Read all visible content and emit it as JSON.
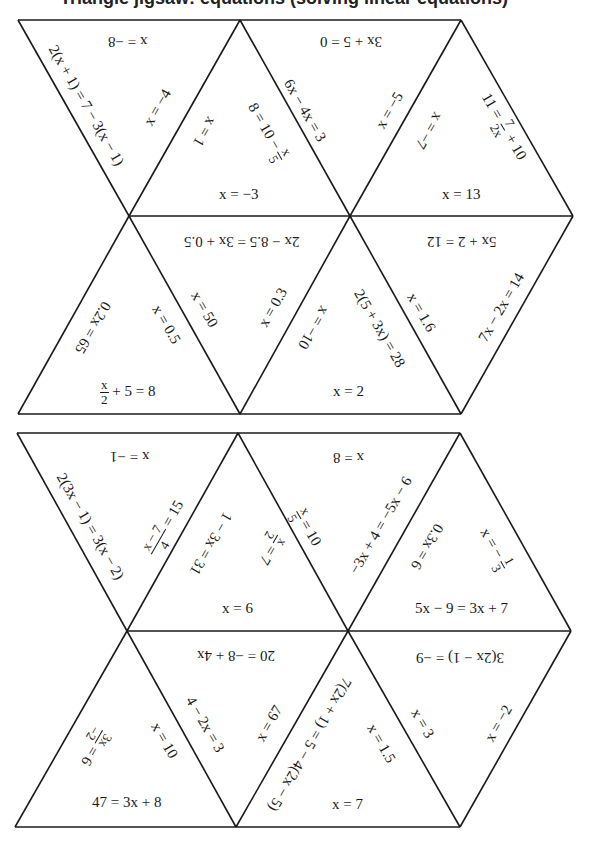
{
  "page": {
    "header_partial": "Triangle jigsaw: equations (solving linear equations)"
  },
  "puzzles": [
    {
      "name": "puzzle-1",
      "triangles": [
        {
          "id": "p1-t1",
          "orientation": "down",
          "edges": {
            "top": "x = −8",
            "left": "2(x + 1) = 7 − 3(x − 1)",
            "right": "x = −4"
          }
        },
        {
          "id": "p1-t2",
          "orientation": "up",
          "edges": {
            "left": "x = 1",
            "right": "8 = 10 − x/5",
            "bottom": "x = −3"
          }
        },
        {
          "id": "p1-t3",
          "orientation": "down",
          "edges": {
            "top": "3x + 5 = 0",
            "left": "6x − 4x = 3",
            "right": "x = −5"
          }
        },
        {
          "id": "p1-t4",
          "orientation": "up",
          "edges": {
            "left": "x = −7",
            "right": "11 = 7/2x + 10",
            "bottom": "x = 13"
          }
        },
        {
          "id": "p1-t5",
          "orientation": "up",
          "edges": {
            "left": "0.2x = 65",
            "right": "x = 0.5",
            "bottom": "x/2 + 5 = 8"
          }
        },
        {
          "id": "p1-t6",
          "orientation": "down",
          "edges": {
            "top": "2x − 8.5 = 3x + 0.5",
            "left": "x = 50",
            "right": "x = 0.3"
          }
        },
        {
          "id": "p1-t7",
          "orientation": "up",
          "edges": {
            "left": "x = −10",
            "right": "2(5 + 3x) = 28",
            "bottom": "x = 2"
          }
        },
        {
          "id": "p1-t8",
          "orientation": "down",
          "edges": {
            "top": "5x + 2 = 12",
            "left": "x = 1.6",
            "right": "7x − 2x = 14"
          }
        }
      ]
    },
    {
      "name": "puzzle-2",
      "triangles": [
        {
          "id": "p2-t1",
          "orientation": "down",
          "edges": {
            "top": "x = −1",
            "left": "2(3x − 1) = 3(x − 2)",
            "right": "(x − 7)/4 = 15"
          }
        },
        {
          "id": "p2-t2",
          "orientation": "up",
          "edges": {
            "left": "1 − 3x = 31",
            "right": "x/2 = 7",
            "bottom": "x = 6"
          }
        },
        {
          "id": "p2-t3",
          "orientation": "down",
          "edges": {
            "top": "x = 8",
            "left": "x/5 = 10",
            "right": "−3x + 4 = −5x − 6"
          }
        },
        {
          "id": "p2-t4",
          "orientation": "up",
          "edges": {
            "left": "0.3x = 6",
            "right": "x = −1/3",
            "bottom": "5x − 9 = 3x + 7"
          }
        },
        {
          "id": "p2-t5",
          "orientation": "up",
          "edges": {
            "left": "3x/−2 = 6",
            "right": "x = 10",
            "bottom": "47 = 3x + 8"
          }
        },
        {
          "id": "p2-t6",
          "orientation": "down",
          "edges": {
            "top": "20 = −8 + 4x",
            "left": "4 − 2x = 3",
            "right": "x = 67"
          }
        },
        {
          "id": "p2-t7",
          "orientation": "up",
          "edges": {
            "left": "7(2x + 1) = 5 − 4(2x − 5)",
            "right": "x = 1.5",
            "bottom": "x = 7"
          }
        },
        {
          "id": "p2-t8",
          "orientation": "down",
          "edges": {
            "top": "3(2x − 1) = −9",
            "left": "x = 3",
            "right": "x = −2"
          }
        }
      ]
    }
  ],
  "labels": {
    "p1": {
      "t1_top": "x = −8",
      "t1_left": "2(x + 1) = 7 − 3(x − 1)",
      "t1_right": "x = −4",
      "t2_left": "x = 1",
      "t2_right_pre": "8 = 10 −",
      "t2_right_num": "x",
      "t2_right_den": "5",
      "t2_bottom": "x = −3",
      "t3_top": "3x + 5 = 0",
      "t3_left": "6x − 4x = 3",
      "t3_right": "x = −5",
      "t4_left": "x = −7",
      "t4_right_pre": "11 =",
      "t4_right_num": "7",
      "t4_right_den": "2x",
      "t4_right_post": "+ 10",
      "t4_bottom": "x = 13",
      "t5_left": "0.2x = 65",
      "t5_right": "x = 0.5",
      "t5_bottom_num": "x",
      "t5_bottom_den": "2",
      "t5_bottom_post": "+ 5 = 8",
      "t6_top": "2x − 8.5 = 3x + 0.5",
      "t6_left": "x = 50",
      "t6_right": "x = 0.3",
      "t7_left": "x = −10",
      "t7_right": "2(5 + 3x) = 28",
      "t7_bottom": "x = 2",
      "t8_top": "5x + 2 = 12",
      "t8_left": "x = 1.6",
      "t8_right": "7x − 2x = 14"
    },
    "p2": {
      "t1_top": "x = −1",
      "t1_left": "2(3x − 1) = 3(x − 2)",
      "t1_right_num": "x − 7",
      "t1_right_den": "4",
      "t1_right_post": "= 15",
      "t2_left": "1 − 3x = 31",
      "t2_right_num": "x",
      "t2_right_den": "2",
      "t2_right_post": "= 7",
      "t2_bottom": "x = 6",
      "t3_top": "x = 8",
      "t3_left_num": "x",
      "t3_left_den": "5",
      "t3_left_post": "= 10",
      "t3_right": "−3x + 4 = −5x − 6",
      "t4_left": "0.3x = 6",
      "t4_right_pre": "x = −",
      "t4_right_num": "1",
      "t4_right_den": "3",
      "t4_bottom": "5x − 9 = 3x + 7",
      "t5_left_num": "3x",
      "t5_left_den": "−2",
      "t5_left_post": "= 6",
      "t5_right": "x = 10",
      "t5_bottom": "47 = 3x + 8",
      "t6_top": "20 = −8 + 4x",
      "t6_left": "4 − 2x = 3",
      "t6_right": "x = 67",
      "t7_left": "7(2x + 1) = 5 − 4(2x − 5)",
      "t7_right": "x = 1.5",
      "t7_bottom": "x = 7",
      "t8_top": "3(2x − 1) = −9",
      "t8_left": "x = 3",
      "t8_right": "x = −2"
    }
  },
  "colors": {
    "line": "#1a1a1a",
    "background": "#ffffff"
  }
}
